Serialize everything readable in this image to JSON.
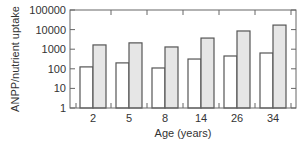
{
  "chart_data": {
    "type": "bar",
    "title": "",
    "xlabel": "Age (years)",
    "ylabel": "ANPP/nutrient uptake",
    "yscale": "log",
    "ylim": [
      1,
      100000
    ],
    "yticks": [
      "1",
      "10",
      "100",
      "1000",
      "10000",
      "100000"
    ],
    "categories": [
      "2",
      "5",
      "8",
      "14",
      "26",
      "34"
    ],
    "series": [
      {
        "name": "series-white",
        "color": "#ffffff",
        "values": [
          125,
          200,
          110,
          315,
          450,
          640
        ]
      },
      {
        "name": "series-grey",
        "color": "#e6e6e6",
        "values": [
          1650,
          2100,
          1300,
          3700,
          8500,
          17000
        ]
      }
    ],
    "grid": false,
    "legend": "none"
  },
  "style": {
    "outline": "#555555",
    "axis": "#666666"
  }
}
